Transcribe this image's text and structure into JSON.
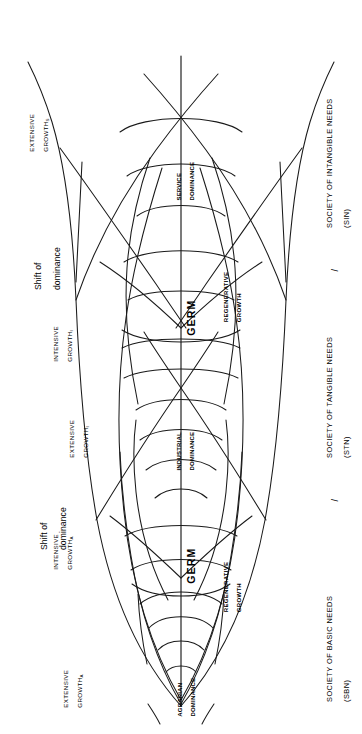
{
  "figure": {
    "orientation": "rotated-90",
    "stroke_color": "#1a1a1a",
    "background_color": "#ffffff"
  },
  "axis_labels": {
    "society_basic": "SOCIETY OF BASIC NEEDS",
    "society_basic_abbr": "(SBN)",
    "society_tangible": "SOCIETY OF TANGIBLE NEEDS",
    "society_tangible_abbr": "(STN)",
    "society_intangible": "SOCIETY OF INTANGIBLE NEEDS",
    "society_intangible_abbr": "(SIN)",
    "separator": "/"
  },
  "shift_markers": [
    {
      "line1": "Shift of",
      "line2": "dominance"
    },
    {
      "line1": "Shift of",
      "line2": "dominance"
    }
  ],
  "growth_labels": [
    {
      "line1": "EXTENSIVE",
      "line2": "GROWTH",
      "subscript": "A"
    },
    {
      "line1": "INTENSIVE",
      "line2": "GROWTH",
      "subscript": "A"
    },
    {
      "line1": "EXTENSIVE",
      "line2": "GROWTH",
      "subscript": "I"
    },
    {
      "line1": "INTENSIVE",
      "line2": "GROWTH",
      "subscript": "I"
    },
    {
      "line1": "EXTENSIVE",
      "line2": "GROWTH",
      "subscript": "S"
    }
  ],
  "regenerative_labels": [
    {
      "line1": "REGENERATIVE",
      "line2": "GROWTH"
    },
    {
      "line1": "REGENERATIVE",
      "line2": "GROWTH"
    }
  ],
  "dominance_labels": [
    {
      "line1": "AGRARIAN",
      "line2": "DOMINANCE"
    },
    {
      "line1": "INDUSTRIAL",
      "line2": "DOMINANCE"
    },
    {
      "line1": "SERVICE",
      "line2": "DOMINANCE"
    }
  ],
  "germ_labels": [
    {
      "text": "GERM"
    },
    {
      "text": "GERM"
    }
  ]
}
